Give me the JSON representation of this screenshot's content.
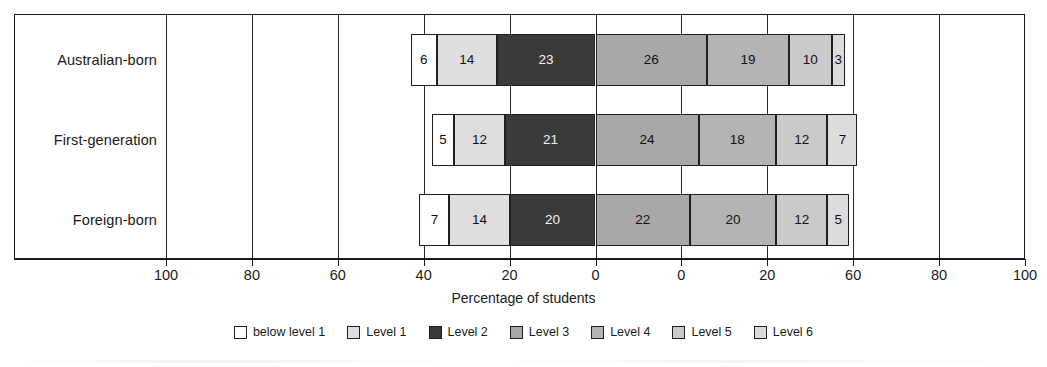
{
  "chart_data": {
    "type": "bar",
    "subtype": "diverging-stacked-horizontal",
    "title": "",
    "xlabel": "Percentage of students",
    "ylabel": "",
    "categories": [
      "Australian-born",
      "First-generation",
      "Foreign-born"
    ],
    "series": [
      {
        "name": "below level 1",
        "values": [
          6,
          5,
          7
        ],
        "color": "#ffffff"
      },
      {
        "name": "Level 1",
        "values": [
          14,
          12,
          14
        ],
        "color": "#dedede"
      },
      {
        "name": "Level 2",
        "values": [
          23,
          21,
          20
        ],
        "color": "#3a3a3a"
      },
      {
        "name": "Level 3",
        "values": [
          26,
          24,
          22
        ],
        "color": "#a8a8a8"
      },
      {
        "name": "Level 4",
        "values": [
          19,
          18,
          20
        ],
        "color": "#b4b4b4"
      },
      {
        "name": "Level 5",
        "values": [
          10,
          12,
          12
        ],
        "color": "#cacaca"
      },
      {
        "name": "Level 6",
        "values": [
          3,
          7,
          5
        ],
        "color": "#dcdcdc"
      }
    ],
    "legend": {
      "position": "bottom",
      "entries": [
        "below level 1",
        "Level 1",
        "Level 2",
        "Level 3",
        "Level 4",
        "Level 5",
        "Level 6"
      ]
    },
    "axis": {
      "tick_labels": [
        "100",
        "80",
        "60",
        "40",
        "20",
        "0",
        "0",
        "20",
        "60",
        "80",
        "100"
      ],
      "tick_values": [
        -100,
        -80,
        -60,
        -40,
        -20,
        0,
        0,
        20,
        60,
        80,
        100
      ],
      "xlim": [
        -100,
        100
      ],
      "grid": true,
      "note": "Axis is mirrored about a centre split; the ninth label reads 60 in the source where 40 would be expected."
    },
    "bars": [
      {
        "category": "Australian-born",
        "zero_offset": 43,
        "segments": [
          {
            "level": "below level 1",
            "value": 6,
            "label": "6"
          },
          {
            "level": "Level 1",
            "value": 14,
            "label": "14"
          },
          {
            "level": "Level 2",
            "value": 23,
            "label": "23"
          },
          {
            "level": "Level 3",
            "value": 26,
            "label": "26"
          },
          {
            "level": "Level 4",
            "value": 19,
            "label": "19"
          },
          {
            "level": "Level 5",
            "value": 10,
            "label": "10"
          },
          {
            "level": "Level 6",
            "value": 3,
            "label": "3"
          }
        ]
      },
      {
        "category": "First-generation",
        "zero_offset": 38,
        "segments": [
          {
            "level": "below level 1",
            "value": 5,
            "label": "5"
          },
          {
            "level": "Level 1",
            "value": 12,
            "label": "12"
          },
          {
            "level": "Level 2",
            "value": 21,
            "label": "21"
          },
          {
            "level": "Level 3",
            "value": 24,
            "label": "24"
          },
          {
            "level": "Level 4",
            "value": 18,
            "label": "18"
          },
          {
            "level": "Level 5",
            "value": 12,
            "label": "12"
          },
          {
            "level": "Level 6",
            "value": 7,
            "label": "7"
          }
        ]
      },
      {
        "category": "Foreign-born",
        "zero_offset": 41,
        "segments": [
          {
            "level": "below level 1",
            "value": 7,
            "label": "7"
          },
          {
            "level": "Level 1",
            "value": 14,
            "label": "14"
          },
          {
            "level": "Level 2",
            "value": 20,
            "label": "20"
          },
          {
            "level": "Level 3",
            "value": 22,
            "label": "22"
          },
          {
            "level": "Level 4",
            "value": 20,
            "label": "20"
          },
          {
            "level": "Level 5",
            "value": 12,
            "label": "12"
          },
          {
            "level": "Level 6",
            "value": 5,
            "label": "5"
          }
        ]
      }
    ]
  }
}
